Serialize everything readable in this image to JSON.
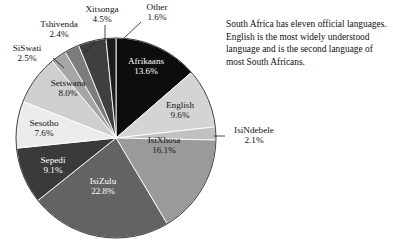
{
  "caption": {
    "text": "South Africa has eleven official languages. English is the most widely understood language and is the second language of most South Africans."
  },
  "chart_data": {
    "type": "pie",
    "title": "",
    "subtitle": "",
    "xlabel": "",
    "ylabel": "",
    "legend_position": "none",
    "grid": false,
    "value_unit": "percent",
    "start_angle_deg": 0,
    "direction": "clockwise",
    "categories": [
      "Afrikaans",
      "English",
      "IsiNdebele",
      "IsiXhosa",
      "IsiZulu",
      "Sepedi",
      "Sesotho",
      "Setswana",
      "SiSwati",
      "Tshivenda",
      "Xitsonga",
      "Other"
    ],
    "values": [
      13.6,
      9.6,
      2.1,
      16.1,
      22.8,
      9.1,
      7.6,
      8.0,
      2.5,
      2.4,
      4.5,
      1.6
    ],
    "value_labels": [
      "13.6%",
      "9.6%",
      "2.1%",
      "16.1%",
      "22.8%",
      "9.1%",
      "7.6%",
      "8.0%",
      "2.5%",
      "2.4%",
      "4.5%",
      "1.6%"
    ],
    "colors": [
      "#0d0d0d",
      "#d4d4d4",
      "#c0c0c0",
      "#9a9a9a",
      "#636363",
      "#3a3a3a",
      "#ececec",
      "#cfcfcf",
      "#a6a6a6",
      "#7c7c7c",
      "#3f3f3f",
      "#1c1c1c"
    ],
    "label_placement": [
      "inside",
      "inside",
      "outside",
      "inside",
      "inside",
      "inside",
      "outside",
      "outside",
      "outside",
      "outside",
      "outside",
      "outside"
    ]
  },
  "slices": {
    "afrikaans": {
      "name": "Afrikaans",
      "pct": "13.6%"
    },
    "english": {
      "name": "English",
      "pct": "9.6%"
    },
    "isindebele": {
      "name": "IsiNdebele",
      "pct": "2.1%"
    },
    "isixhosa": {
      "name": "IsiXhosa",
      "pct": "16.1%"
    },
    "isizulu": {
      "name": "IsiZulu",
      "pct": "22.8%"
    },
    "sepedi": {
      "name": "Sepedi",
      "pct": "9.1%"
    },
    "sesotho": {
      "name": "Sesotho",
      "pct": "7.6%"
    },
    "setswana": {
      "name": "Setswana",
      "pct": "8.0%"
    },
    "siswati": {
      "name": "SiSwati",
      "pct": "2.5%"
    },
    "tshivenda": {
      "name": "Tshivenda",
      "pct": "2.4%"
    },
    "xitsonga": {
      "name": "Xitsonga",
      "pct": "4.5%"
    },
    "other": {
      "name": "Other",
      "pct": "1.6%"
    }
  }
}
